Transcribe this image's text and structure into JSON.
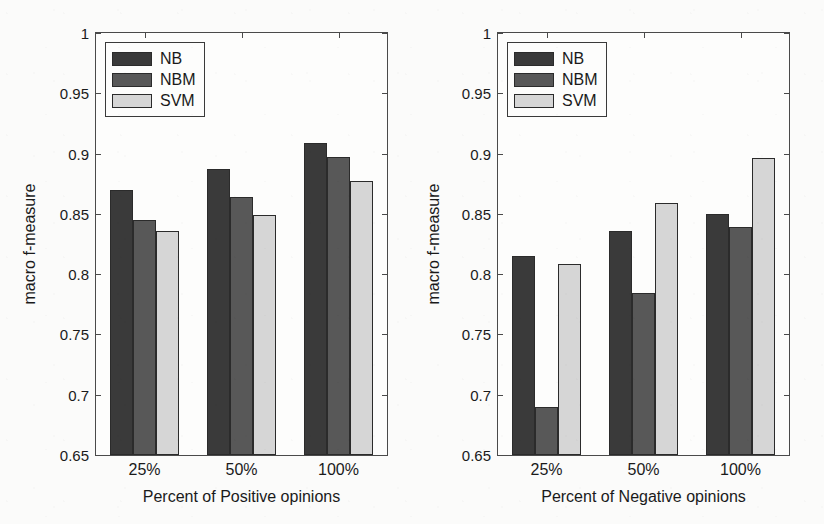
{
  "figure": {
    "width": 824,
    "height": 524,
    "background": "#fbfbfa",
    "panel_count": 2
  },
  "series_colors": {
    "NB": "#3a3a3a",
    "NBM": "#585858",
    "SVM": "#d6d6d6"
  },
  "chart_data": [
    {
      "type": "bar",
      "title": "",
      "subtitle": "",
      "xlabel": "Percent of Positive opinions",
      "ylabel": "macro f-measure",
      "categories": [
        "25%",
        "50%",
        "100%"
      ],
      "series": [
        {
          "name": "NB",
          "values": [
            0.87,
            0.887,
            0.909
          ]
        },
        {
          "name": "NBM",
          "values": [
            0.845,
            0.864,
            0.897
          ]
        },
        {
          "name": "SVM",
          "values": [
            0.836,
            0.849,
            0.877
          ]
        }
      ],
      "ylim": [
        0.65,
        1
      ],
      "ytick_labels": [
        "1",
        "0.95",
        "0.9",
        "0.85",
        "0.8",
        "0.75",
        "0.7",
        "0.65"
      ],
      "ytick_values": [
        1,
        0.95,
        0.9,
        0.85,
        0.8,
        0.75,
        0.7,
        0.65
      ],
      "grid": false,
      "legend_position": "top-left",
      "legend_entries": [
        "NB",
        "NBM",
        "SVM"
      ]
    },
    {
      "type": "bar",
      "title": "",
      "subtitle": "",
      "xlabel": "Percent of Negative opinions",
      "ylabel": "macro f-measure",
      "categories": [
        "25%",
        "50%",
        "100%"
      ],
      "series": [
        {
          "name": "NB",
          "values": [
            0.815,
            0.836,
            0.85
          ]
        },
        {
          "name": "NBM",
          "values": [
            0.69,
            0.784,
            0.839
          ]
        },
        {
          "name": "SVM",
          "values": [
            0.808,
            0.859,
            0.896
          ]
        }
      ],
      "ylim": [
        0.65,
        1
      ],
      "ytick_labels": [
        "1",
        "0.95",
        "0.9",
        "0.85",
        "0.8",
        "0.75",
        "0.7",
        "0.65"
      ],
      "ytick_values": [
        1,
        0.95,
        0.9,
        0.85,
        0.8,
        0.75,
        0.7,
        0.65
      ],
      "grid": false,
      "legend_position": "top-left",
      "legend_entries": [
        "NB",
        "NBM",
        "SVM"
      ]
    }
  ]
}
